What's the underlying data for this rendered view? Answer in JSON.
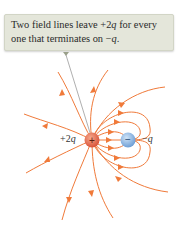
{
  "callout": {
    "line1_prefix": "Two field lines leave +2",
    "line1_var": "q",
    "line1_suffix": " for every",
    "line2_prefix": "one that terminates on −",
    "line2_var": "q",
    "line2_suffix": "."
  },
  "charges": {
    "positive": {
      "label_prefix": "+2",
      "label_var": "q",
      "symbol": "+",
      "color": "#e0684a"
    },
    "negative": {
      "label_prefix": "−",
      "label_var": "q",
      "symbol": "−",
      "color": "#7fb0e0"
    }
  },
  "colors": {
    "field_line": "#f07a3a",
    "pointer": "#9a9a9a",
    "callout_bg": "#e4e6da"
  }
}
